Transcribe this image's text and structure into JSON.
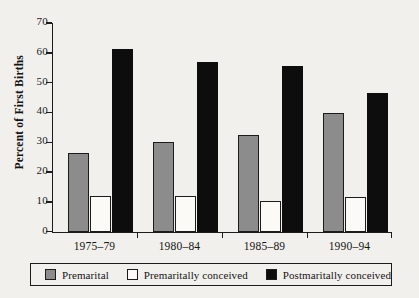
{
  "chart_data": {
    "type": "bar",
    "title": "",
    "xlabel": "",
    "ylabel": "Percent of First Births",
    "categories": [
      "1975–79",
      "1980–84",
      "1985–89",
      "1990–94"
    ],
    "series": [
      {
        "name": "Premarital",
        "color": "#8c8c8c",
        "values": [
          26.3,
          30.0,
          32.3,
          39.7
        ]
      },
      {
        "name": "Premaritally conceived",
        "color": "#ffffff",
        "values": [
          11.8,
          11.8,
          10.3,
          11.7
        ]
      },
      {
        "name": "Postmaritally conceived",
        "color": "#0d0d0d",
        "values": [
          61.3,
          57.0,
          55.7,
          46.5
        ]
      }
    ],
    "ylim": [
      0,
      70
    ],
    "yticks": [
      0,
      10,
      20,
      30,
      40,
      50,
      60,
      70
    ],
    "ytick_labels": [
      "0",
      "10",
      "20",
      "30",
      "40",
      "50",
      "60",
      "70"
    ],
    "grid": false,
    "legend_position": "bottom"
  },
  "axis": {
    "y_title": "Percent of First Births"
  },
  "legend": {
    "items": [
      {
        "label": "Premarital",
        "swatch": "#8c8c8c"
      },
      {
        "label": "Premaritally conceived",
        "swatch": "#fbfaf7"
      },
      {
        "label": "Postmaritally conceived",
        "swatch": "#0d0d0d"
      }
    ]
  }
}
